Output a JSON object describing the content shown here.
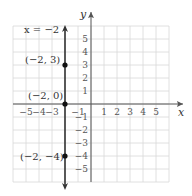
{
  "chart_data": {
    "type": "line",
    "title": "",
    "xlabel": "x",
    "ylabel": "y",
    "xlim": [
      -6,
      6
    ],
    "ylim": [
      -6,
      6
    ],
    "grid": true,
    "x_ticks": [
      -5,
      -4,
      -3,
      -1,
      1,
      2,
      3,
      4,
      5
    ],
    "y_ticks": [
      5,
      4,
      3,
      2,
      1,
      -1,
      -2,
      -3,
      -4,
      -5
    ],
    "series": [
      {
        "name": "x = -2",
        "kind": "vertical_line",
        "x": -2,
        "color": "#333333"
      }
    ],
    "points": [
      {
        "x": -2,
        "y": 3,
        "label": "(−2, 3)"
      },
      {
        "x": -2,
        "y": 0,
        "label": "(−2, 0)"
      },
      {
        "x": -2,
        "y": -4,
        "label": "(−2, −4)"
      }
    ],
    "annotations": [
      {
        "text": "x = −2",
        "x": -2,
        "y": 5.5
      }
    ]
  },
  "labels": {
    "equation": "x = −2",
    "p1": "(−2, 3)",
    "p2": "(−2, 0)",
    "p3": "(−2, −4)",
    "x_axis": "x",
    "y_axis": "y"
  }
}
